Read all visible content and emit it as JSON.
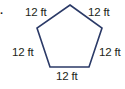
{
  "problem_marker": ".",
  "shape": {
    "type": "regular-pentagon",
    "stroke_color": "#2b3a67",
    "vertices": [
      [
        70,
        5
      ],
      [
        102,
        28
      ],
      [
        89,
        67
      ],
      [
        50,
        67
      ],
      [
        37,
        28
      ]
    ]
  },
  "side_labels": {
    "top_left": "12 ft",
    "top_right": "12 ft",
    "left": "12 ft",
    "right": "12 ft",
    "bottom": "12 ft"
  }
}
